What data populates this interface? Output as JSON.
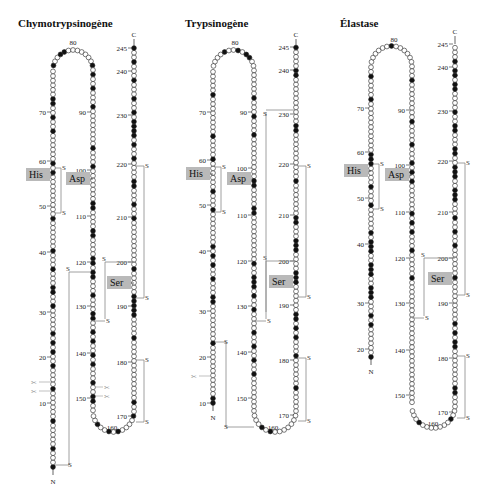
{
  "panels": [
    {
      "title": "Chymotrypsinogène",
      "x0": 18,
      "leftCol": {
        "x": 53,
        "top": 65,
        "bottom": 467,
        "start": 1,
        "loopTopY": 42
      },
      "midCol": {
        "x": 93
      },
      "rightCol": {
        "x": 134,
        "top": 47
      },
      "ticks_left": [
        {
          "n": "70",
          "y": 112
        },
        {
          "n": "60",
          "y": 161
        },
        {
          "n": "50",
          "y": 206
        },
        {
          "n": "40",
          "y": 252
        },
        {
          "n": "30",
          "y": 312
        },
        {
          "n": "20",
          "y": 357
        },
        {
          "n": "10",
          "y": 403
        }
      ],
      "ticks_mid": [
        {
          "n": "90",
          "y": 112
        },
        {
          "n": "100",
          "y": 170
        },
        {
          "n": "110",
          "y": 216
        },
        {
          "n": "120",
          "y": 262
        },
        {
          "n": "130",
          "y": 306
        },
        {
          "n": "140",
          "y": 353
        },
        {
          "n": "150",
          "y": 398
        }
      ],
      "ticks_right": [
        {
          "n": "245",
          "y": 48
        },
        {
          "n": "240",
          "y": 71
        },
        {
          "n": "230",
          "y": 115
        },
        {
          "n": "220",
          "y": 164
        },
        {
          "n": "210",
          "y": 217
        },
        {
          "n": "200",
          "y": 262
        },
        {
          "n": "190",
          "y": 306
        },
        {
          "n": "180",
          "y": 362
        },
        {
          "n": "170",
          "y": 416
        }
      ],
      "top_label": {
        "n": "80",
        "x": 73,
        "y": 27
      },
      "bottom_label": {
        "n": "160",
        "x": 112,
        "y": 430
      },
      "C": "C",
      "N": "N",
      "His": "His",
      "Asp": "Asp",
      "Ser": "Ser",
      "hisY": 176,
      "aspY": 180,
      "serY": 284,
      "bottomY": 440
    },
    {
      "title": "Trypsinogène",
      "x0": 185,
      "leftCol": {
        "x": 213,
        "top": 65,
        "start": 10,
        "loopTopY": 42
      },
      "midCol": {
        "x": 254
      },
      "rightCol": {
        "x": 296,
        "top": 47
      },
      "ticks_left": [
        {
          "n": "70",
          "y": 112
        },
        {
          "n": "60",
          "y": 160
        },
        {
          "n": "50",
          "y": 205
        },
        {
          "n": "40",
          "y": 251
        },
        {
          "n": "30",
          "y": 311
        },
        {
          "n": "20",
          "y": 357
        },
        {
          "n": "10",
          "y": 403
        }
      ],
      "ticks_mid": [
        {
          "n": "90",
          "y": 112
        },
        {
          "n": "100",
          "y": 168
        },
        {
          "n": "110",
          "y": 215
        },
        {
          "n": "120",
          "y": 261
        },
        {
          "n": "130",
          "y": 306
        },
        {
          "n": "140",
          "y": 352
        },
        {
          "n": "150",
          "y": 398
        }
      ],
      "ticks_right": [
        {
          "n": "245",
          "y": 47
        },
        {
          "n": "240",
          "y": 70
        },
        {
          "n": "230",
          "y": 114
        },
        {
          "n": "220",
          "y": 164
        },
        {
          "n": "210",
          "y": 215
        },
        {
          "n": "200",
          "y": 261
        },
        {
          "n": "190",
          "y": 305
        },
        {
          "n": "180",
          "y": 360
        },
        {
          "n": "170",
          "y": 415
        }
      ],
      "top_label": {
        "n": "80",
        "x": 235,
        "y": 27
      },
      "bottom_label": {
        "n": "160",
        "x": 273,
        "y": 430
      },
      "C": "C",
      "N": "N",
      "His": "His",
      "Asp": "Asp",
      "Ser": "Ser",
      "hisY": 175,
      "aspY": 180,
      "serY": 283,
      "bottomY": 440
    },
    {
      "title": "Élastase",
      "x0": 340,
      "leftCol": {
        "x": 371,
        "top": 60,
        "start": 16,
        "loopTopY": 38
      },
      "midCol": {
        "x": 412
      },
      "rightCol": {
        "x": 455,
        "top": 44
      },
      "ticks_left": [
        {
          "n": "70",
          "y": 108
        },
        {
          "n": "60",
          "y": 152
        },
        {
          "n": "50",
          "y": 198
        },
        {
          "n": "40",
          "y": 244
        },
        {
          "n": "30",
          "y": 303
        },
        {
          "n": "20",
          "y": 349
        }
      ],
      "ticks_mid": [
        {
          "n": "90",
          "y": 110
        },
        {
          "n": "100",
          "y": 165
        },
        {
          "n": "110",
          "y": 212
        },
        {
          "n": "120",
          "y": 258
        },
        {
          "n": "130",
          "y": 303
        },
        {
          "n": "140",
          "y": 350
        },
        {
          "n": "150",
          "y": 395
        }
      ],
      "ticks_right": [
        {
          "n": "245",
          "y": 44
        },
        {
          "n": "240",
          "y": 67
        },
        {
          "n": "230",
          "y": 111
        },
        {
          "n": "220",
          "y": 161
        },
        {
          "n": "210",
          "y": 212
        },
        {
          "n": "200",
          "y": 258
        },
        {
          "n": "190",
          "y": 303
        },
        {
          "n": "180",
          "y": 358
        },
        {
          "n": "170",
          "y": 412
        }
      ],
      "top_label": {
        "n": "80",
        "x": 394,
        "y": 24
      },
      "bottom_label": {
        "n": "160",
        "x": 433,
        "y": 426
      },
      "C": "C",
      "N": "N",
      "His": "His",
      "Asp": "Asp",
      "Ser": "Ser",
      "hisY": 172,
      "aspY": 176,
      "serY": 280,
      "bottomY": 436
    }
  ],
  "disulfide_label": "S",
  "cleavage_icon": "scissors-icon",
  "colors": {
    "box": "#b9b9b9",
    "stroke": "#222222",
    "bridge": "#888888",
    "filled": "#111111"
  }
}
